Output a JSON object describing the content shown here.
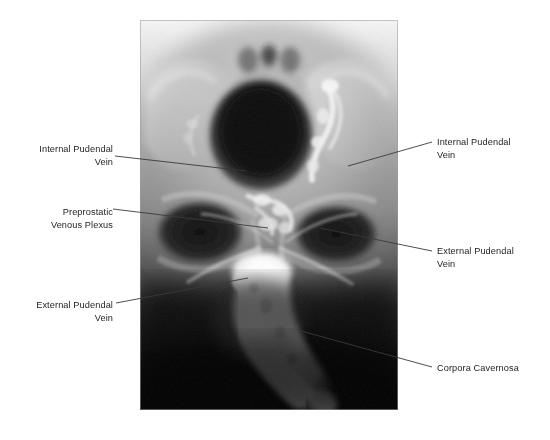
{
  "figure": {
    "kind": "radiograph-annotated-figure",
    "modality_caption": "",
    "background_color": "#ffffff",
    "image_area": {
      "x": 140,
      "y": 20,
      "width": 258,
      "height": 390,
      "border_color": "#b8b8b8"
    }
  },
  "annotations": [
    {
      "id": "internal-pudendal-vein-left",
      "text": "Internal Pudendal\nVein",
      "side": "left",
      "text_box": {
        "x": 28,
        "y": 143,
        "width": 85
      },
      "leader": {
        "x1": 115,
        "y1": 156,
        "x2": 246,
        "y2": 171
      }
    },
    {
      "id": "preprostatic-venous-plexus",
      "text": "Preprostatic\nVenous Plexus",
      "side": "left",
      "text_box": {
        "x": 28,
        "y": 206,
        "width": 85
      },
      "leader": {
        "x1": 113,
        "y1": 209,
        "x2": 268,
        "y2": 228
      }
    },
    {
      "id": "external-pudendal-vein-left",
      "text": "External Pudendal\nVein",
      "side": "left",
      "text_box": {
        "x": 18,
        "y": 299,
        "width": 95
      },
      "leader": {
        "x1": 116,
        "y1": 303,
        "x2": 248,
        "y2": 278
      }
    },
    {
      "id": "internal-pudendal-vein-right",
      "text": "Internal Pudendal\nVein",
      "side": "right",
      "text_box": {
        "x": 437,
        "y": 136,
        "width": 100
      },
      "leader": {
        "x1": 348,
        "y1": 166,
        "x2": 432,
        "y2": 142
      }
    },
    {
      "id": "external-pudendal-vein-right",
      "text": "External Pudendal\nVein",
      "side": "right",
      "text_box": {
        "x": 437,
        "y": 245,
        "width": 100
      },
      "leader": {
        "x1": 320,
        "y1": 228,
        "x2": 432,
        "y2": 251
      }
    },
    {
      "id": "corpora-cavernosa",
      "text": "Corpora Cavernosa",
      "side": "right",
      "text_box": {
        "x": 437,
        "y": 362,
        "width": 105
      },
      "leader": {
        "x1": 301,
        "y1": 331,
        "x2": 432,
        "y2": 367
      }
    }
  ],
  "anatomy_legend": {
    "bladder": "urinary bladder (radiolucent dark oval)",
    "contrast_filled": "corpora cavernosa opacified with contrast",
    "pelvic_bone": "bony pelvis / obturator foramina"
  },
  "colors": {
    "leader_line": "#3a3a3a",
    "label_text": "#1d1d1d",
    "page_background": "#ffffff",
    "film_dark": "#050505",
    "film_bright": "#ffffff"
  }
}
